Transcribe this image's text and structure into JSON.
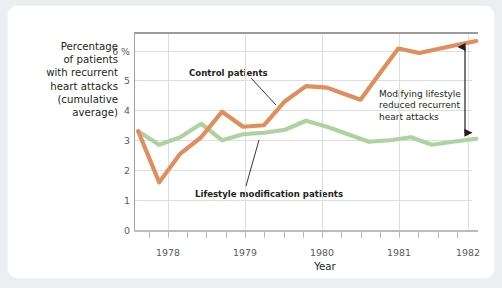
{
  "chart_data": {
    "type": "line",
    "title": "",
    "subtitle": "",
    "xlabel": "Year",
    "ylabel": "Percentage of patients with recurrent heart attacks (cumulative average)",
    "ylabel_lines": [
      "Percentage",
      "of patients",
      "with recurrent",
      "heart attacks",
      "(cumulative",
      "average)"
    ],
    "ylim": [
      0,
      6.6
    ],
    "xlim": [
      1977.9,
      1982.0
    ],
    "ytick_labels": [
      "0",
      "1",
      "2",
      "3",
      "4",
      "5",
      "6 %"
    ],
    "ytick_values": [
      0,
      1,
      2,
      3,
      4,
      5,
      6
    ],
    "xtick_labels": [
      "1978",
      "1979",
      "1980",
      "1981",
      "1982"
    ],
    "xtick_values": [
      1978,
      1979,
      1980,
      1981,
      1982
    ],
    "minor_xticks_per_year": 4,
    "grid": "horizontal",
    "legend": "inline-annotations",
    "series": [
      {
        "name": "Control patients",
        "color": "#df8e5d",
        "x": [
          1977.95,
          1978.2,
          1978.45,
          1978.7,
          1978.95,
          1979.2,
          1979.45,
          1979.7,
          1979.95,
          1980.2,
          1980.35,
          1980.6,
          1980.85,
          1981.05,
          1981.3,
          1981.55,
          1981.8,
          1981.98
        ],
        "values": [
          3.3,
          1.6,
          2.55,
          3.1,
          3.95,
          3.45,
          3.5,
          4.3,
          4.8,
          4.75,
          4.6,
          4.35,
          5.3,
          6.05,
          5.9,
          6.05,
          6.2,
          6.3
        ]
      },
      {
        "name": "Lifestyle modification patients",
        "color": "#aed3a0",
        "x": [
          1977.95,
          1978.2,
          1978.45,
          1978.7,
          1978.95,
          1979.2,
          1979.45,
          1979.7,
          1979.95,
          1980.2,
          1980.45,
          1980.7,
          1980.95,
          1981.2,
          1981.45,
          1981.7,
          1981.98
        ],
        "values": [
          3.3,
          2.85,
          3.1,
          3.55,
          3.0,
          3.2,
          3.25,
          3.35,
          3.65,
          3.45,
          3.2,
          2.95,
          3.0,
          3.1,
          2.85,
          2.95,
          3.05
        ]
      }
    ],
    "annotations": [
      {
        "id": "control-label",
        "text": "Control patients",
        "target_series": "Control patients",
        "leader": true
      },
      {
        "id": "lifestyle-label",
        "text": "Lifestyle modification patients",
        "target_series": "Lifestyle modification patients",
        "leader": true
      },
      {
        "id": "gap-callout",
        "text": "Modifying lifestyle reduced recurrent heart attacks",
        "lines": [
          "Modifying lifestyle",
          "reduced recurrent",
          "heart attacks"
        ],
        "arrow": "double-headed-vertical",
        "arrow_top_value": 6.3,
        "arrow_bottom_value": 3.05
      }
    ],
    "colors": {
      "control_line": "#df8e5d",
      "lifestyle_line": "#aed3a0",
      "grid": "#d9dcdd",
      "axis": "#9a9a9a",
      "text": "#231f20",
      "tick_text": "#58595b",
      "card_background": "#ffffff",
      "page_background": "#eceff1",
      "arrow": "#231f20"
    }
  }
}
